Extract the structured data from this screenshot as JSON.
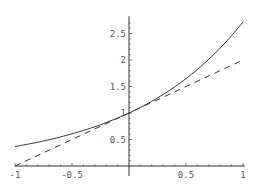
{
  "chart_data": {
    "type": "line",
    "title": "",
    "xlabel": "",
    "ylabel": "",
    "xlim": [
      -1,
      1
    ],
    "ylim": [
      0,
      2.75
    ],
    "grid": false,
    "legend": null,
    "x_ticks": [
      {
        "value": -1,
        "label": "-1"
      },
      {
        "value": -0.5,
        "label": "-0.5"
      },
      {
        "value": 0.5,
        "label": "0.5"
      },
      {
        "value": 1,
        "label": "1"
      }
    ],
    "y_ticks": [
      {
        "value": 0.5,
        "label": "0.5"
      },
      {
        "value": 1,
        "label": "1"
      },
      {
        "value": 1.5,
        "label": "1.5"
      },
      {
        "value": 2,
        "label": "2"
      },
      {
        "value": 2.5,
        "label": "2.5"
      }
    ],
    "series": [
      {
        "name": "exp(x)",
        "style": "solid",
        "color": "#333333",
        "x": [
          -1,
          -0.75,
          -0.5,
          -0.25,
          0,
          0.25,
          0.5,
          0.75,
          1
        ],
        "values": [
          0.368,
          0.472,
          0.607,
          0.779,
          1.0,
          1.284,
          1.649,
          2.117,
          2.718
        ]
      },
      {
        "name": "1 + x",
        "style": "dashed",
        "color": "#333333",
        "x": [
          -1,
          1
        ],
        "values": [
          0,
          2
        ]
      }
    ]
  },
  "colors": {
    "axis": "#333333",
    "curve": "#333333",
    "text": "#555555"
  }
}
